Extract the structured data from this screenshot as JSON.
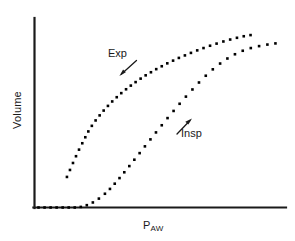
{
  "chart_data": {
    "type": "line",
    "title": "",
    "subtitle": "",
    "xlabel_main": "P",
    "xlabel_sub": "AW",
    "ylabel": "Volume",
    "xlabel": "PAW",
    "grid": false,
    "legend_position": "inline-annotations",
    "axis_color": "#1a1a1a",
    "marker_color": "#000000",
    "marker_style": "square-dotted",
    "background_color": "#ffffff",
    "xlim": [
      0,
      100
    ],
    "ylim": [
      0,
      100
    ],
    "axis_ticks": false,
    "annotations": [
      {
        "name": "exp-annotation",
        "text": "Exp",
        "points_to": "expiratory-curve",
        "arrow_direction": "down-left"
      },
      {
        "name": "insp-annotation",
        "text": "Insp",
        "points_to": "inspiratory-curve",
        "arrow_direction": "up-left"
      }
    ],
    "series": [
      {
        "name": "Exp",
        "full_name": "Expiratory limb",
        "label": "Exp",
        "x": [
          12.9,
          14.1,
          15.3,
          16.5,
          17.7,
          19.0,
          20.2,
          21.4,
          22.8,
          24.3,
          25.9,
          27.5,
          29.2,
          30.9,
          32.7,
          34.5,
          36.4,
          38.3,
          40.2,
          42.2,
          44.2,
          46.3,
          48.4,
          50.6,
          52.8,
          55.1,
          57.4,
          59.8,
          62.2,
          64.7,
          67.2,
          69.8,
          72.4,
          75.1,
          77.8,
          80.5,
          83.2,
          85.9
        ],
        "y": [
          15.8,
          19.4,
          23.0,
          26.5,
          29.9,
          33.2,
          36.3,
          39.3,
          42.2,
          45.0,
          47.6,
          50.1,
          52.5,
          54.8,
          57.0,
          59.1,
          61.1,
          63.0,
          64.8,
          66.6,
          68.3,
          69.9,
          71.5,
          73.0,
          74.5,
          75.9,
          77.3,
          78.6,
          79.9,
          81.2,
          82.4,
          83.6,
          84.7,
          85.8,
          86.8,
          87.7,
          88.5,
          89.1
        ]
      },
      {
        "name": "Insp",
        "full_name": "Inspiratory limb",
        "label": "Insp",
        "x": [
          1.6,
          4.0,
          6.4,
          8.8,
          11.2,
          13.6,
          16.0,
          18.4,
          20.8,
          23.2,
          25.6,
          28.0,
          30.0,
          31.9,
          33.8,
          35.7,
          37.7,
          39.7,
          41.8,
          43.9,
          46.1,
          48.3,
          50.6,
          52.9,
          55.3,
          57.7,
          60.2,
          62.8,
          65.4,
          68.1,
          70.9,
          73.8,
          76.7,
          79.7,
          82.8,
          86.0,
          89.3,
          92.6,
          95.8
        ],
        "y": [
          0.0,
          0.0,
          0.0,
          0.0,
          0.0,
          0.0,
          0.0,
          0.3,
          1.2,
          2.6,
          4.6,
          7.1,
          9.6,
          12.3,
          15.2,
          18.2,
          21.4,
          24.7,
          28.1,
          31.6,
          35.2,
          38.8,
          42.5,
          46.2,
          49.9,
          53.6,
          57.3,
          61.0,
          64.6,
          68.1,
          71.4,
          74.4,
          77.0,
          79.2,
          81.0,
          82.4,
          83.4,
          84.2,
          84.8
        ]
      }
    ]
  }
}
